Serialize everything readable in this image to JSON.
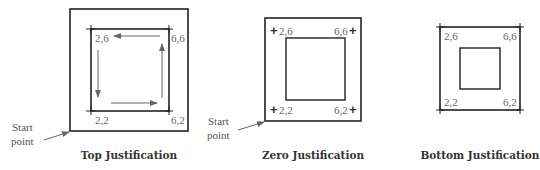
{
  "figure": {
    "panels": [
      {
        "id": "top",
        "caption": "Top Justification",
        "start_label_line1": "Start",
        "start_label_line2": "point",
        "coords": {
          "tl": "2,6",
          "tr": "6,6",
          "bl": "2,2",
          "br": "6,2"
        },
        "has_direction_arrows": true
      },
      {
        "id": "zero",
        "caption": "Zero Justification",
        "start_label_line1": "Start",
        "start_label_line2": "point",
        "coords": {
          "tl": "2,6",
          "tr": "6,6",
          "bl": "2,2",
          "br": "6,2"
        },
        "plus_marker": "+"
      },
      {
        "id": "bottom",
        "caption": "Bottom Justification",
        "coords": {
          "tl": "2,6",
          "tr": "6,6",
          "bl": "2,2",
          "br": "6,2"
        }
      }
    ],
    "colors": {
      "line": "#222222",
      "arrow": "#666666",
      "text": "#666666",
      "caption": "#333333"
    }
  }
}
